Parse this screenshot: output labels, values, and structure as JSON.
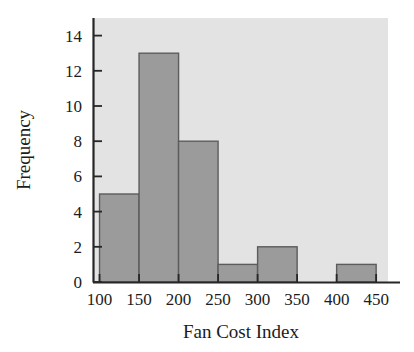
{
  "chart_data": {
    "type": "bar",
    "title": "",
    "subtitle": "",
    "xlabel": "Fan Cost Index",
    "ylabel": "Frequency",
    "categories": [
      "100-150",
      "150-200",
      "200-250",
      "250-300",
      "300-350",
      "350-400",
      "400-450"
    ],
    "bin_edges": [
      100,
      150,
      200,
      250,
      300,
      350,
      400,
      450
    ],
    "values": [
      5,
      13,
      8,
      1,
      2,
      0,
      1
    ],
    "bin_width": 50,
    "xlim": [
      93,
      465
    ],
    "ylim": [
      0,
      15
    ],
    "x_ticks": [
      100,
      150,
      200,
      250,
      300,
      350,
      400,
      450
    ],
    "y_ticks": [
      0,
      2,
      4,
      6,
      8,
      10,
      12,
      14
    ],
    "x_tick_labels": [
      "100",
      "150",
      "200",
      "250",
      "300",
      "350",
      "400",
      "450"
    ],
    "y_tick_labels": [
      "0",
      "2",
      "4",
      "6",
      "8",
      "10",
      "12",
      "14"
    ],
    "grid": false,
    "legend": null,
    "legend_position": "none",
    "colors": {
      "bar_fill": "#9b9b9b",
      "bar_edge": "#5c5c5c",
      "plot_background": "#e3e3e3",
      "figure_background": "#ffffff",
      "axis_line": "#262626",
      "text": "#1c1c1c"
    },
    "tick_direction": "in"
  }
}
